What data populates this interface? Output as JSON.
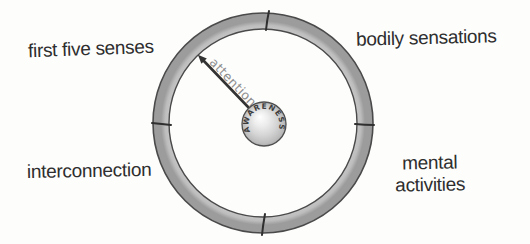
{
  "colors": {
    "background": "#fdfdfc",
    "text": "#2e2e2e",
    "ring-outline": "#4a4a4a",
    "divider": "#2f2f2f",
    "arrow": "#333333",
    "attention-text": "#8e8e8e",
    "awareness-text": "#3d3d3d"
  },
  "ring_labels": {
    "top_left": "first five senses",
    "top_right": "bodily sensations",
    "bottom_left": "interconnection",
    "bottom_right": [
      "mental",
      "activities"
    ]
  },
  "hub_label": "AWARENESS",
  "spoke_label": "attention"
}
